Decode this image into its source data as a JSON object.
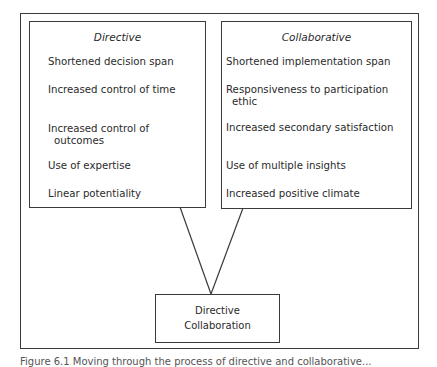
{
  "diagram": {
    "left_box": {
      "title": "Directive",
      "items": [
        "Shortened decision span",
        "Increased control of time",
        "Increased control of",
        "outcomes",
        "Use of expertise",
        "Linear potentiality"
      ]
    },
    "right_box": {
      "title": "Collaborative",
      "items": [
        "Shortened implementation span",
        "Responsiveness to participation",
        "ethic",
        "Increased secondary satisfaction",
        "Use of multiple insights",
        "Increased positive climate"
      ]
    },
    "bottom_box": {
      "line1": "Directive",
      "line2": "Collaboration"
    },
    "connector_color": "#3a3a3a"
  },
  "caption": {
    "text": "Figure 6.1  Moving through the process of directive and collaborative..."
  }
}
